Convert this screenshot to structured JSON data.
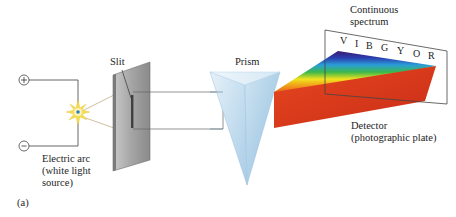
{
  "figure": {
    "panel_label": "(a)",
    "labels": {
      "slit": "Slit",
      "prism": "Prism",
      "spectrum_line1": "Continuous",
      "spectrum_line2": "spectrum",
      "detector_line1": "Detector",
      "detector_line2": "(photographic plate)",
      "arc_line1": "Electric arc",
      "arc_line2": "(white light",
      "arc_line3": "source)"
    },
    "terminals": {
      "positive": "+",
      "negative": "−"
    },
    "spectrum_letters": [
      "V",
      "I",
      "B",
      "G",
      "Y",
      "O",
      "R"
    ],
    "colors": {
      "wire": "#555555",
      "slit_plate": "#9a9a9a",
      "prism": "#bcd9ec",
      "red_beam": "#d7361c",
      "spark": "#f3d64a",
      "spark_core": "#2f7fc4"
    }
  }
}
